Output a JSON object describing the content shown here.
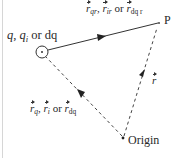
{
  "figure": {
    "points": {
      "charge": {
        "label": "q, q_i or dq",
        "x": 42,
        "y": 52
      },
      "P": {
        "label": "P",
        "x": 160,
        "y": 23
      },
      "origin": {
        "label": "Origin",
        "x": 123,
        "y": 138
      }
    },
    "labels": {
      "charge": {
        "q": "q",
        "comma1": ", ",
        "qi": "q",
        "qi_sub": "i",
        "or": " or ",
        "dq": "dq"
      },
      "source_to_field": {
        "v1": "r",
        "v1_sub": "qr",
        "sep1": ", ",
        "v2": "r",
        "v2_sub": "ir",
        "or": " or ",
        "v3": "r",
        "v3_sub": "dq r"
      },
      "origin_to_source": {
        "v1": "r",
        "v1_sub": "q",
        "sep1": ", ",
        "v2": "r",
        "v2_sub": "i",
        "or": " or ",
        "v3": "r",
        "v3_sub": "dq"
      },
      "origin_to_field": {
        "v": "r"
      },
      "P": "P",
      "origin": "Origin"
    },
    "vectors": [
      {
        "name": "source-to-field",
        "from": "charge",
        "to": "P",
        "style": "solid"
      },
      {
        "name": "origin-to-source",
        "from": "origin",
        "to": "charge",
        "style": "dashed"
      },
      {
        "name": "origin-to-field",
        "from": "origin",
        "to": "P",
        "style": "dashed"
      }
    ],
    "colors": {
      "line": "#333333",
      "text": "#2a2a2a",
      "frame": "#d6d6d6",
      "background": "#ffffff"
    }
  }
}
